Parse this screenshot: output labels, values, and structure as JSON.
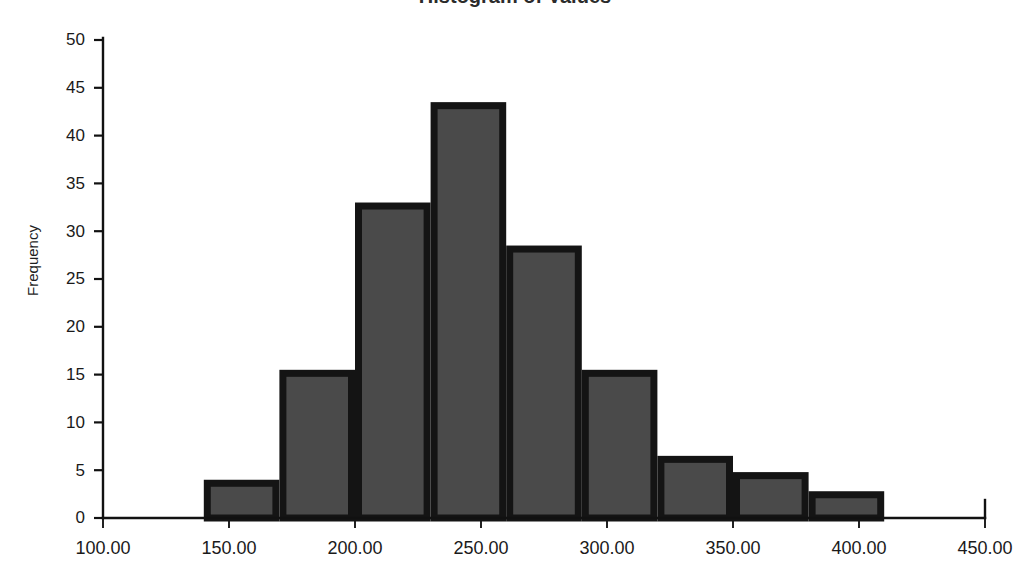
{
  "chart_data": {
    "type": "bar",
    "title": "Histogram of Values",
    "title_cropped": true,
    "xlabel": "",
    "ylabel": "Frequency",
    "grid": false,
    "legend": "none",
    "bar_fill_color": "#4a4a4a",
    "bar_border_color": "#141414",
    "axis_color": "#111111",
    "xlim": [
      100.0,
      450.0
    ],
    "ylim": [
      0,
      50
    ],
    "x_tick_labels": [
      "100.00",
      "150.00",
      "200.00",
      "250.00",
      "300.00",
      "350.00",
      "400.00",
      "450.00"
    ],
    "x_tick_values": [
      100,
      150,
      200,
      250,
      300,
      350,
      400,
      450
    ],
    "y_tick_labels": [
      "0",
      "5",
      "10",
      "15",
      "20",
      "25",
      "30",
      "35",
      "40",
      "45",
      "50"
    ],
    "y_tick_values": [
      0,
      5,
      10,
      15,
      20,
      25,
      30,
      35,
      40,
      45,
      50
    ],
    "bin_width": 30,
    "bin_edges": [
      140,
      170,
      200,
      230,
      260,
      290,
      320,
      350,
      380,
      410
    ],
    "categories": [
      "140-170",
      "170-200",
      "200-230",
      "230-260",
      "260-290",
      "290-320",
      "320-350",
      "350-380",
      "380-410"
    ],
    "values": [
      4,
      15.5,
      33,
      43.5,
      28.5,
      15.5,
      6.5,
      4.8,
      2.8
    ]
  },
  "axes": {
    "y_axis_name": "frequency-axis",
    "x_axis_name": "value-axis"
  }
}
